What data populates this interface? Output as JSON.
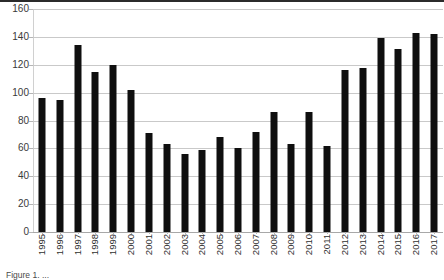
{
  "figure": {
    "background_color": "#ffffff",
    "top_rule_color": "#2b2b2b",
    "caption": "Figure 1. ..."
  },
  "chart_data": {
    "type": "bar",
    "title": "",
    "subtitle": "",
    "xlabel": "",
    "ylabel": "",
    "categories": [
      "1995",
      "1996",
      "1997",
      "1998",
      "1999",
      "2000",
      "2001",
      "2002",
      "2003",
      "2004",
      "2005",
      "2006",
      "2007",
      "2008",
      "2009",
      "2010",
      "2011",
      "2012",
      "2013",
      "2014",
      "2015",
      "2016",
      "2017"
    ],
    "values": [
      96,
      95,
      134,
      115,
      120,
      102,
      71,
      63,
      56,
      59,
      68,
      60,
      72,
      86,
      63,
      86,
      62,
      116,
      118,
      139,
      131,
      143,
      142
    ],
    "series": [
      {
        "name": "",
        "color": "#0f0f0f",
        "values": [
          96,
          95,
          134,
          115,
          120,
          102,
          71,
          63,
          56,
          59,
          68,
          60,
          72,
          86,
          63,
          86,
          62,
          116,
          118,
          139,
          131,
          143,
          142
        ]
      }
    ],
    "ylim": [
      0,
      160
    ],
    "ytick_values": [
      0,
      20,
      40,
      60,
      80,
      100,
      120,
      140,
      160
    ],
    "ytick_labels": [
      "0",
      "20",
      "40",
      "60",
      "80",
      "100",
      "120",
      "140",
      "160"
    ],
    "xtick_label_rotation": 90,
    "grid": true,
    "grid_axis": "y",
    "grid_color": "#c9c9c9",
    "legend": false,
    "legend_position": "none",
    "bar_color": "#0f0f0f",
    "annotations": []
  }
}
